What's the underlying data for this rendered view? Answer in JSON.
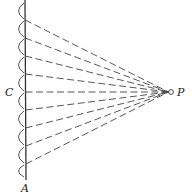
{
  "labels": {
    "top_wavefront_center": "C",
    "point": "P",
    "bottom_end": "A"
  },
  "geometry": {
    "wavefront_x": 25,
    "wavefront_top": 0,
    "wavefront_bottom": 180,
    "point_x": 171,
    "point_y": 92,
    "ray_start_ys": [
      20,
      38,
      56,
      74,
      92,
      110,
      128,
      146,
      164
    ]
  },
  "colors": {
    "ink": "#333333",
    "background": "#ffffff"
  }
}
